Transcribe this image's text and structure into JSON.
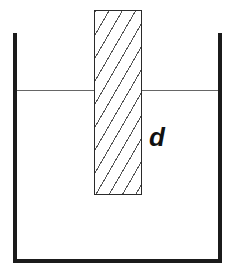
{
  "diagram": {
    "depth_label": "d",
    "colors": {
      "background": "#ffffff",
      "wall_ink": "#1b1b1b",
      "rod_outline": "#2a2a2a",
      "hatch_line": "#555555",
      "liquid_line": "#666666",
      "label_ink": "#111111"
    }
  }
}
